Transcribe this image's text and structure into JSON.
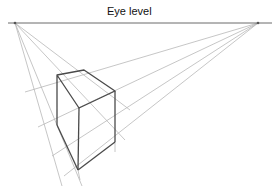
{
  "horizon": {
    "label": "Eye level",
    "y": 23,
    "x1": 8,
    "x2": 272
  },
  "vanishing_points": {
    "left": {
      "x": 15,
      "y": 23
    },
    "right": {
      "x": 258,
      "y": 23
    }
  },
  "box_vertices": {
    "top_left": [
      57,
      75
    ],
    "top_back": [
      84,
      70
    ],
    "top_right": [
      115,
      91
    ],
    "top_front": [
      79,
      108
    ],
    "bottom_left": [
      57,
      125
    ],
    "bottom_front": [
      78,
      170
    ],
    "bottom_right": [
      115,
      142
    ]
  },
  "colors": {
    "background": "#ffffff",
    "box_edge": "#4a4a4a",
    "guide_line": "#b8b8b8",
    "horizon_line": "#6a6a6a",
    "text": "#111111"
  }
}
